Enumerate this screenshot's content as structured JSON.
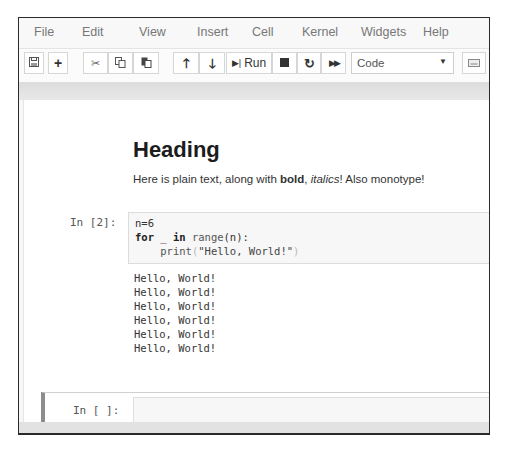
{
  "menubar": {
    "items": [
      "File",
      "Edit",
      "View",
      "Insert",
      "Cell",
      "Kernel",
      "Widgets",
      "Help"
    ]
  },
  "toolbar": {
    "save_icon": "floppy-disk",
    "add_icon": "+",
    "cut_icon": "scissors",
    "copy_icon": "copy",
    "paste_icon": "paste",
    "move_up_icon": "arrow-up",
    "move_down_icon": "arrow-down",
    "run_label": "Run",
    "stop_icon": "square",
    "restart_icon": "redo",
    "run_all_icon": "fast-forward",
    "cell_type": "Code",
    "keyboard_icon": "keyboard"
  },
  "markdown_cell": {
    "heading": "Heading",
    "text_before": "Here is plain text, along with ",
    "bold": "bold",
    "comma": ", ",
    "italic": "italics",
    "text_after": "! Also monotype!"
  },
  "code_cell": {
    "prompt": "In [2]:",
    "lines": [
      "n=6",
      "for _ in range(n):",
      "    print(\"Hello, World!\")"
    ],
    "output": [
      "Hello, World!",
      "Hello, World!",
      "Hello, World!",
      "Hello, World!",
      "Hello, World!",
      "Hello, World!"
    ]
  },
  "empty_cell": {
    "prompt": "In [ ]:",
    "value": ""
  }
}
